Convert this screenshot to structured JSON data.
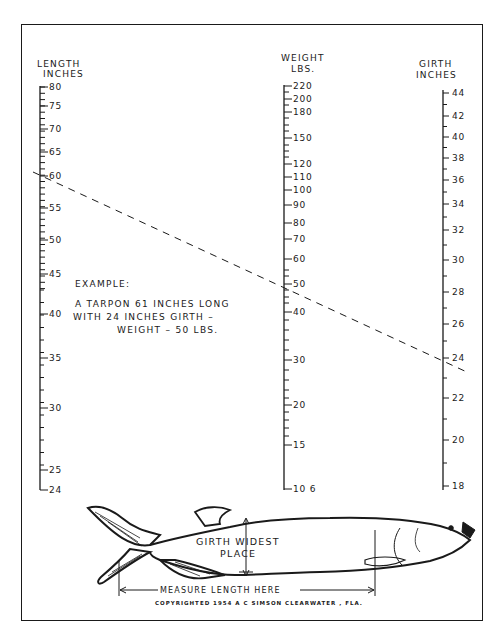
{
  "chart_data": {
    "type": "nomogram",
    "axes": [
      {
        "name": "length",
        "label_line1": "LENGTH",
        "label_line2": "INCHES",
        "labels": [
          "80",
          "75",
          "70",
          "65",
          "60",
          "55",
          "50",
          "45",
          "40",
          "35",
          "30",
          "25",
          "24"
        ],
        "min": 24,
        "max": 80
      },
      {
        "name": "weight",
        "label_line1": "WEIGHT",
        "label_line2": "LBS.",
        "labels": [
          "220",
          "200",
          "180",
          "150",
          "120",
          "110",
          "100",
          "90",
          "80",
          "70",
          "60",
          "50",
          "40",
          "30",
          "20",
          "15",
          "10 6"
        ],
        "min": 10.6,
        "max": 220
      },
      {
        "name": "girth",
        "label_line1": "GIRTH",
        "label_line2": "INCHES",
        "labels": [
          "44",
          "42",
          "40",
          "38",
          "36",
          "34",
          "32",
          "30",
          "28",
          "26",
          "24",
          "22",
          "20",
          "18"
        ],
        "min": 18,
        "max": 44
      }
    ],
    "example_line": {
      "length": 61,
      "girth": 24,
      "weight": 50
    }
  },
  "example": {
    "heading": "EXAMPLE:",
    "line1": "A TARPON 61 INCHES LONG",
    "line2": "WITH 24 INCHES GIRTH    –",
    "line3": "WEIGHT – 50 LBS."
  },
  "fish": {
    "girth_line1": "GIRTH WIDEST",
    "girth_line2": "PLACE",
    "measure": "MEASURE  LENGTH  HERE",
    "copyright": "COPYRIGHTED 1954 A C SIMSON   CLEARWATER , FLA."
  }
}
